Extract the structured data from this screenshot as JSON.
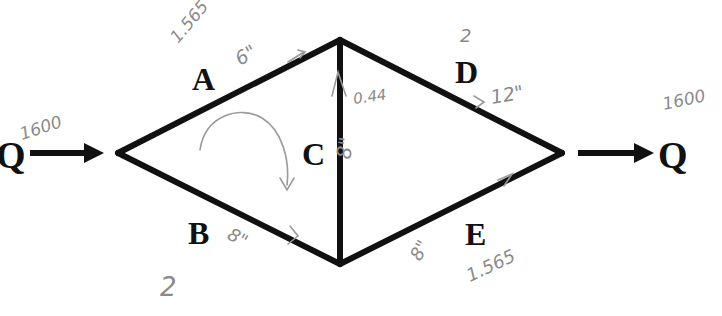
{
  "diagram": {
    "type": "pipe-network",
    "inflow": {
      "label": "Q",
      "value": "1600"
    },
    "outflow": {
      "label": "Q",
      "value": "1600"
    },
    "pipes": [
      {
        "id": "A",
        "label": "A",
        "diameter": "6\"",
        "flow": "1.565"
      },
      {
        "id": "B",
        "label": "B",
        "diameter": "8\"",
        "loop_count": "2"
      },
      {
        "id": "C",
        "label": "C",
        "diameter": "8\"",
        "flow": "0.44"
      },
      {
        "id": "D",
        "label": "D",
        "diameter": "12\"",
        "loop_count": "2"
      },
      {
        "id": "E",
        "label": "E",
        "diameter": "8\"",
        "flow": "1.565"
      }
    ],
    "annotations": {
      "loop_direction": "clockwise"
    }
  }
}
